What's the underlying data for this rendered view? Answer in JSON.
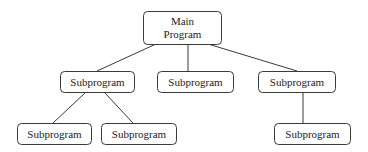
{
  "diagram": {
    "type": "hierarchy-chart",
    "nodes": [
      {
        "id": "main",
        "lines": [
          "Main",
          "Program"
        ]
      },
      {
        "id": "sub_left",
        "lines": [
          "Subprogram"
        ]
      },
      {
        "id": "sub_center",
        "lines": [
          "Subprogram"
        ]
      },
      {
        "id": "sub_right",
        "lines": [
          "Subprogram"
        ]
      },
      {
        "id": "sub_left_a",
        "lines": [
          "Subprogram"
        ]
      },
      {
        "id": "sub_left_b",
        "lines": [
          "Subprogram"
        ]
      },
      {
        "id": "sub_right_a",
        "lines": [
          "Subprogram"
        ]
      }
    ],
    "edges": [
      {
        "from": "main",
        "to": "sub_left"
      },
      {
        "from": "main",
        "to": "sub_center"
      },
      {
        "from": "main",
        "to": "sub_right"
      },
      {
        "from": "sub_left",
        "to": "sub_left_a"
      },
      {
        "from": "sub_left",
        "to": "sub_left_b"
      },
      {
        "from": "sub_right",
        "to": "sub_right_a"
      }
    ]
  }
}
